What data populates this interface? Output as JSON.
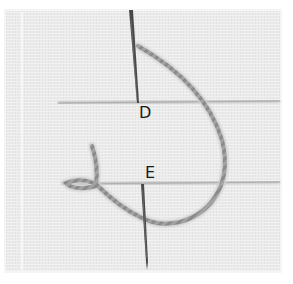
{
  "illustration": {
    "subject": "embroidery stitch step on woven fabric",
    "labels": [
      {
        "id": "D",
        "text": "D"
      },
      {
        "id": "E",
        "text": "E"
      }
    ],
    "colors": {
      "page_background": "#ffffff",
      "fabric": "#ebebeb",
      "fabric_border": "#f4f4f4",
      "guide_line": "#a9a9a9",
      "needle": "#4a4a4a",
      "thread": "#9a9a9a",
      "label_text": "#1a1a1a"
    }
  }
}
